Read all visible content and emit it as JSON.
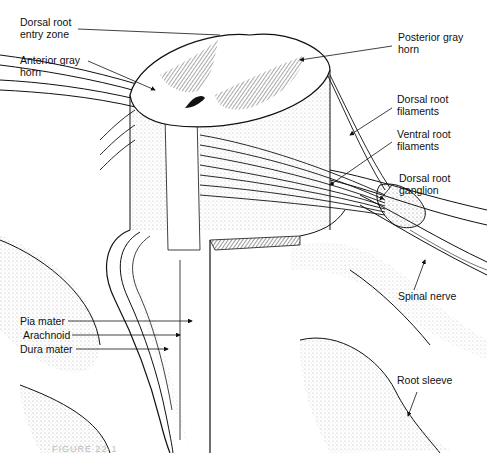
{
  "figure": {
    "caption_partial": "FIGURE 22-1"
  },
  "labels": {
    "dorsal_root_entry_zone": "Dorsal root\nentry zone",
    "anterior_gray_horn": "Anterior gray\nhorn",
    "posterior_gray_horn": "Posterior gray\nhorn",
    "dorsal_root_filaments": "Dorsal root\nfilaments",
    "ventral_root_filaments": "Ventral root\nfilaments",
    "dorsal_root_ganglion": "Dorsal root\nganglion",
    "spinal_nerve": "Spinal nerve",
    "pia_mater": "Pia mater",
    "arachnoid": "Arachnoid",
    "dura_mater": "Dura mater",
    "root_sleeve": "Root sleeve"
  },
  "colors": {
    "ink": "#111111",
    "stipple": "#9a9a9a",
    "gray_matter": "#555555",
    "background": "#ffffff"
  }
}
